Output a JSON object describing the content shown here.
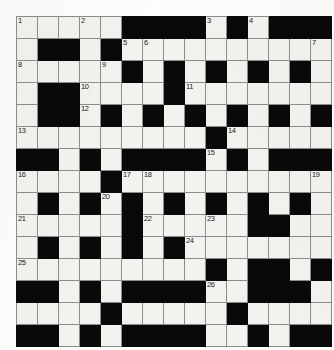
{
  "puzzle": {
    "title": "Crossword Grid",
    "rows": 15,
    "cols": 15,
    "cell_px": 20,
    "colors": {
      "block": "#090909",
      "cell": "#f2f2ee",
      "grid_line": "#8d8d8d",
      "page_background": "#fdfdfb",
      "number_text": "#1b1b1b"
    },
    "blocks": [
      [
        0,
        5
      ],
      [
        0,
        6
      ],
      [
        0,
        7
      ],
      [
        0,
        8
      ],
      [
        0,
        10
      ],
      [
        0,
        12
      ],
      [
        0,
        13
      ],
      [
        0,
        14
      ],
      [
        1,
        1
      ],
      [
        1,
        2
      ],
      [
        1,
        4
      ],
      [
        2,
        5
      ],
      [
        2,
        7
      ],
      [
        2,
        9
      ],
      [
        2,
        11
      ],
      [
        2,
        13
      ],
      [
        3,
        1
      ],
      [
        3,
        2
      ],
      [
        3,
        7
      ],
      [
        4,
        1
      ],
      [
        4,
        2
      ],
      [
        4,
        4
      ],
      [
        4,
        6
      ],
      [
        4,
        8
      ],
      [
        4,
        10
      ],
      [
        4,
        12
      ],
      [
        4,
        14
      ],
      [
        5,
        9
      ],
      [
        6,
        0
      ],
      [
        6,
        1
      ],
      [
        6,
        3
      ],
      [
        6,
        5
      ],
      [
        6,
        6
      ],
      [
        6,
        7
      ],
      [
        6,
        8
      ],
      [
        6,
        10
      ],
      [
        6,
        12
      ],
      [
        6,
        13
      ],
      [
        6,
        14
      ],
      [
        7,
        4
      ],
      [
        8,
        1
      ],
      [
        8,
        3
      ],
      [
        8,
        5
      ],
      [
        8,
        7
      ],
      [
        8,
        9
      ],
      [
        8,
        11
      ],
      [
        8,
        13
      ],
      [
        9,
        5
      ],
      [
        9,
        11
      ],
      [
        9,
        12
      ],
      [
        10,
        1
      ],
      [
        10,
        3
      ],
      [
        10,
        5
      ],
      [
        10,
        7
      ],
      [
        11,
        9
      ],
      [
        11,
        11
      ],
      [
        11,
        12
      ],
      [
        11,
        14
      ],
      [
        12,
        0
      ],
      [
        12,
        1
      ],
      [
        12,
        3
      ],
      [
        12,
        5
      ],
      [
        12,
        6
      ],
      [
        12,
        7
      ],
      [
        12,
        8
      ],
      [
        12,
        11
      ],
      [
        12,
        12
      ],
      [
        12,
        13
      ],
      [
        13,
        4
      ],
      [
        13,
        10
      ],
      [
        14,
        0
      ],
      [
        14,
        1
      ],
      [
        14,
        3
      ],
      [
        14,
        5
      ],
      [
        14,
        6
      ],
      [
        14,
        7
      ],
      [
        14,
        8
      ],
      [
        14,
        11
      ],
      [
        14,
        13
      ],
      [
        14,
        14
      ]
    ],
    "numbers": [
      {
        "row": 0,
        "col": 0,
        "label": "1"
      },
      {
        "row": 0,
        "col": 3,
        "label": "2"
      },
      {
        "row": 0,
        "col": 9,
        "label": "3"
      },
      {
        "row": 0,
        "col": 11,
        "label": "4"
      },
      {
        "row": 1,
        "col": 5,
        "label": "5"
      },
      {
        "row": 1,
        "col": 6,
        "label": "6"
      },
      {
        "row": 1,
        "col": 14,
        "label": "7"
      },
      {
        "row": 2,
        "col": 0,
        "label": "8"
      },
      {
        "row": 2,
        "col": 4,
        "label": "9"
      },
      {
        "row": 3,
        "col": 3,
        "label": "10"
      },
      {
        "row": 3,
        "col": 8,
        "label": "11"
      },
      {
        "row": 4,
        "col": 3,
        "label": "12"
      },
      {
        "row": 5,
        "col": 0,
        "label": "13"
      },
      {
        "row": 5,
        "col": 10,
        "label": "14"
      },
      {
        "row": 6,
        "col": 9,
        "label": "15"
      },
      {
        "row": 7,
        "col": 0,
        "label": "16"
      },
      {
        "row": 7,
        "col": 5,
        "label": "17"
      },
      {
        "row": 7,
        "col": 6,
        "label": "18"
      },
      {
        "row": 7,
        "col": 14,
        "label": "19"
      },
      {
        "row": 8,
        "col": 4,
        "label": "20"
      },
      {
        "row": 9,
        "col": 0,
        "label": "21"
      },
      {
        "row": 9,
        "col": 6,
        "label": "22"
      },
      {
        "row": 9,
        "col": 9,
        "label": "23"
      },
      {
        "row": 10,
        "col": 8,
        "label": "24"
      },
      {
        "row": 11,
        "col": 0,
        "label": "25"
      },
      {
        "row": 12,
        "col": 9,
        "label": "26"
      }
    ],
    "letters": []
  }
}
